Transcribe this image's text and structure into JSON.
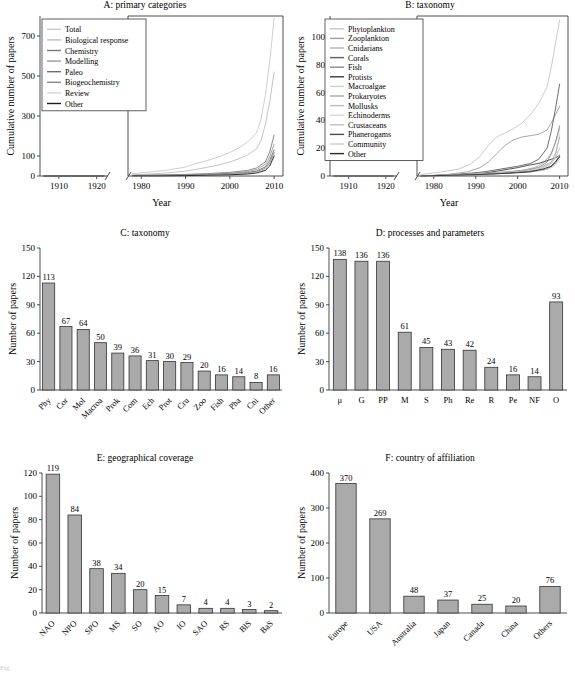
{
  "figure": {
    "width": 575,
    "height": 678,
    "caption_fragment": "Fig."
  },
  "chart_data": [
    {
      "id": "A",
      "type": "line",
      "title": "A: primary categories",
      "xlabel": "Year",
      "ylabel": "Cumulative number of papers",
      "broken_axis": true,
      "xlim_left": [
        1905,
        1923
      ],
      "xlim_right": [
        1977,
        2012
      ],
      "xticks_left": [
        1910,
        1920
      ],
      "xticks_right": [
        1980,
        1990,
        2000,
        2010
      ],
      "yticks": [
        0,
        100,
        300,
        500,
        700
      ],
      "ylim": [
        0,
        800
      ],
      "legend_position": "top-left",
      "series": [
        {
          "name": "Total",
          "color": "#c9c9c9",
          "x": [
            1978,
            1982,
            1986,
            1990,
            1992,
            1994,
            1996,
            1998,
            2000,
            2002,
            2004,
            2006,
            2007,
            2008,
            2009,
            2010
          ],
          "values": [
            12,
            20,
            30,
            45,
            60,
            72,
            85,
            100,
            118,
            140,
            170,
            215,
            280,
            400,
            570,
            790
          ]
        },
        {
          "name": "Biological response",
          "color": "#bdbdbd",
          "x": [
            1978,
            1982,
            1986,
            1990,
            1992,
            1994,
            1996,
            1998,
            2000,
            2002,
            2004,
            2006,
            2007,
            2008,
            2009,
            2010
          ],
          "values": [
            6,
            10,
            16,
            24,
            32,
            40,
            48,
            58,
            70,
            86,
            106,
            135,
            175,
            255,
            370,
            520
          ]
        },
        {
          "name": "Chemistry",
          "color": "#7a7a7a",
          "x": [
            1978,
            1984,
            1990,
            1995,
            2000,
            2004,
            2006,
            2008,
            2009,
            2010
          ],
          "values": [
            3,
            5,
            8,
            12,
            18,
            28,
            40,
            70,
            120,
            205
          ]
        },
        {
          "name": "Modelling",
          "color": "#9a9a9a",
          "x": [
            1978,
            1984,
            1990,
            1995,
            2000,
            2004,
            2006,
            2008,
            2009,
            2010
          ],
          "values": [
            2,
            4,
            6,
            9,
            14,
            22,
            32,
            58,
            95,
            160
          ]
        },
        {
          "name": "Paleo",
          "color": "#6e6e6e",
          "x": [
            1978,
            1984,
            1990,
            1995,
            2000,
            2004,
            2006,
            2008,
            2009,
            2010
          ],
          "values": [
            2,
            3,
            5,
            7,
            11,
            17,
            25,
            45,
            78,
            130
          ]
        },
        {
          "name": "Biogeochemistry",
          "color": "#868686",
          "x": [
            1978,
            1984,
            1990,
            1995,
            2000,
            2004,
            2006,
            2008,
            2009,
            2010
          ],
          "values": [
            1,
            2,
            4,
            6,
            9,
            14,
            21,
            38,
            66,
            118
          ]
        },
        {
          "name": "Review",
          "color": "#d4d4d4",
          "x": [
            1978,
            1984,
            1990,
            1995,
            2000,
            2004,
            2006,
            2008,
            2009,
            2010
          ],
          "values": [
            1,
            2,
            3,
            5,
            8,
            12,
            18,
            32,
            56,
            102
          ]
        },
        {
          "name": "Other",
          "color": "#1a1a1a",
          "x": [
            1978,
            1984,
            1990,
            1995,
            2000,
            2004,
            2006,
            2008,
            2009,
            2010
          ],
          "values": [
            1,
            1,
            2,
            4,
            6,
            10,
            15,
            28,
            50,
            100
          ]
        }
      ]
    },
    {
      "id": "B",
      "type": "line",
      "title": "B: taxonomy",
      "xlabel": "Year",
      "ylabel": "Cumulative number of papers",
      "broken_axis": true,
      "xlim_left": [
        1905,
        1923
      ],
      "xlim_right": [
        1976,
        2012
      ],
      "xticks_left": [
        1910,
        1920
      ],
      "xticks_right": [
        1980,
        1990,
        2000,
        2010
      ],
      "yticks": [
        0,
        20,
        40,
        60,
        80,
        100
      ],
      "ylim": [
        0,
        115
      ],
      "legend_position": "top-left",
      "series": [
        {
          "name": "Phytoplankton",
          "color": "#c4c4c4",
          "x": [
            1977,
            1982,
            1986,
            1989,
            1991,
            1993,
            1995,
            1997,
            1999,
            2001,
            2003,
            2005,
            2007,
            2008,
            2009,
            2010
          ],
          "values": [
            1,
            3,
            5,
            9,
            14,
            22,
            28,
            31,
            34,
            38,
            44,
            52,
            64,
            78,
            95,
            112
          ]
        },
        {
          "name": "Zooplankton",
          "color": "#9f9f9f",
          "x": [
            1977,
            1983,
            1988,
            1991,
            1993,
            1995,
            1997,
            1999,
            2001,
            2003,
            2005,
            2007,
            2008,
            2009,
            2010
          ],
          "values": [
            0,
            1,
            3,
            6,
            10,
            16,
            22,
            26,
            28,
            29,
            30,
            33,
            38,
            44,
            50
          ]
        },
        {
          "name": "Cnidarians",
          "color": "#b0b0b0",
          "x": [
            1977,
            1985,
            1992,
            1997,
            2001,
            2004,
            2006,
            2008,
            2009,
            2010
          ],
          "values": [
            0,
            1,
            2,
            3,
            4,
            6,
            9,
            16,
            24,
            34
          ]
        },
        {
          "name": "Corals",
          "color": "#5e5e5e",
          "x": [
            1977,
            1985,
            1992,
            1996,
            2000,
            2003,
            2005,
            2007,
            2008,
            2009,
            2010
          ],
          "values": [
            0,
            1,
            3,
            5,
            7,
            9,
            12,
            20,
            32,
            48,
            66
          ]
        },
        {
          "name": "Fish",
          "color": "#8a8a8a",
          "x": [
            1977,
            1986,
            1993,
            1998,
            2002,
            2005,
            2007,
            2008,
            2009,
            2010
          ],
          "values": [
            0,
            1,
            2,
            3,
            4,
            6,
            10,
            16,
            24,
            36
          ]
        },
        {
          "name": "Protists",
          "color": "#3d3d3d",
          "x": [
            1977,
            1986,
            1992,
            1996,
            2000,
            2003,
            2005,
            2007,
            2008,
            2009,
            2010
          ],
          "values": [
            0,
            1,
            2,
            4,
            6,
            8,
            9,
            11,
            12,
            13,
            15
          ]
        },
        {
          "name": "Macroalgae",
          "color": "#cfcfcf",
          "x": [
            1977,
            1986,
            1993,
            1999,
            2003,
            2006,
            2008,
            2009,
            2010
          ],
          "values": [
            0,
            1,
            2,
            3,
            4,
            6,
            9,
            14,
            30
          ]
        },
        {
          "name": "Prokaryotes",
          "color": "#a8a8a8",
          "x": [
            1977,
            1987,
            1994,
            1999,
            2003,
            2006,
            2008,
            2009,
            2010
          ],
          "values": [
            0,
            1,
            2,
            3,
            5,
            7,
            10,
            16,
            28
          ]
        },
        {
          "name": "Mollusks",
          "color": "#bcbcbc",
          "x": [
            1977,
            1988,
            1995,
            2000,
            2004,
            2006,
            2008,
            2009,
            2010
          ],
          "values": [
            0,
            1,
            2,
            3,
            4,
            6,
            9,
            13,
            20
          ]
        },
        {
          "name": "Echinoderms",
          "color": "#d8d8d8",
          "x": [
            1977,
            1989,
            1996,
            2001,
            2005,
            2007,
            2008,
            2009,
            2010
          ],
          "values": [
            0,
            1,
            2,
            3,
            4,
            5,
            7,
            10,
            16
          ]
        },
        {
          "name": "Crustaceans",
          "color": "#c0c0c0",
          "x": [
            1977,
            1989,
            1997,
            2002,
            2005,
            2007,
            2008,
            2009,
            2010
          ],
          "values": [
            0,
            1,
            2,
            3,
            4,
            5,
            7,
            9,
            14
          ]
        },
        {
          "name": "Phanerogams",
          "color": "#4a4a4a",
          "x": [
            1977,
            1990,
            1997,
            2002,
            2005,
            2007,
            2008,
            2009,
            2010
          ],
          "values": [
            0,
            1,
            2,
            3,
            4,
            5,
            7,
            10,
            14
          ]
        },
        {
          "name": "Community",
          "color": "#cacaca",
          "x": [
            1977,
            1990,
            1998,
            2003,
            2006,
            2008,
            2009,
            2010
          ],
          "values": [
            0,
            1,
            2,
            3,
            4,
            6,
            8,
            12
          ]
        },
        {
          "name": "Other",
          "color": "#2a2a2a",
          "x": [
            1977,
            1990,
            1998,
            2003,
            2006,
            2008,
            2009,
            2010
          ],
          "values": [
            0,
            1,
            2,
            3,
            5,
            7,
            10,
            14
          ]
        }
      ]
    },
    {
      "id": "C",
      "type": "bar",
      "title": "C: taxonomy",
      "xlabel": "",
      "ylabel": "Number of papers",
      "yticks": [
        0,
        30,
        60,
        90,
        120,
        150
      ],
      "ylim": [
        0,
        150
      ],
      "categories": [
        "Phy",
        "Cor",
        "Mol",
        "Macroa",
        "Prok",
        "Com",
        "Ech",
        "Prot",
        "Cru",
        "Zoo",
        "Fish",
        "Pha",
        "Cni",
        "Other"
      ],
      "values": [
        113,
        67,
        64,
        50,
        39,
        36,
        31,
        30,
        29,
        20,
        16,
        14,
        8,
        16
      ],
      "bar_color": "#aaaaaa"
    },
    {
      "id": "D",
      "type": "bar",
      "title": "D: processes and parameters",
      "xlabel": "",
      "ylabel": "Number of papers",
      "yticks": [
        0,
        30,
        60,
        90,
        120,
        150
      ],
      "ylim": [
        0,
        150
      ],
      "categories": [
        "μ",
        "G",
        "PP",
        "M",
        "S",
        "Ph",
        "Re",
        "R",
        "Pe",
        "NF",
        "O"
      ],
      "values": [
        138,
        136,
        136,
        61,
        45,
        43,
        42,
        24,
        16,
        14,
        93
      ],
      "bar_color": "#aaaaaa"
    },
    {
      "id": "E",
      "type": "bar",
      "title": "E: geographical coverage",
      "xlabel": "",
      "ylabel": "Number of papers",
      "yticks": [
        0,
        20,
        40,
        60,
        80,
        100,
        120
      ],
      "ylim": [
        0,
        120
      ],
      "categories": [
        "NAO",
        "NPO",
        "SPO",
        "MS",
        "SO",
        "AO",
        "IO",
        "SAO",
        "RS",
        "BlS",
        "BaS"
      ],
      "values": [
        119,
        84,
        38,
        34,
        20,
        15,
        7,
        4,
        4,
        3,
        2
      ],
      "bar_color": "#aaaaaa"
    },
    {
      "id": "F",
      "type": "bar",
      "title": "F: country of affiliation",
      "xlabel": "",
      "ylabel": "Number of papers",
      "yticks": [
        0,
        100,
        200,
        300,
        400
      ],
      "ylim": [
        0,
        400
      ],
      "categories": [
        "Europe",
        "USA",
        "Australia",
        "Japan",
        "Canada",
        "China",
        "Others"
      ],
      "values": [
        370,
        269,
        48,
        37,
        25,
        20,
        76
      ],
      "bar_color": "#aaaaaa"
    }
  ]
}
